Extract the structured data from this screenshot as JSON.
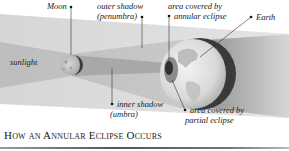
{
  "diagram": {
    "title": "How an Annular Eclipse Occurs",
    "labels": {
      "moon": "Moon",
      "sunlight": "sunlight",
      "outer_shadow_line1": "outer shadow",
      "outer_shadow_line2": "(penumbra)",
      "inner_shadow_line1": "inner shadow",
      "inner_shadow_line2": "(umbra)",
      "annular_line1": "area covered by",
      "annular_line2": "annular eclipse",
      "partial_line1": "area covered by",
      "partial_line2": "partial eclipse",
      "earth": "Earth"
    },
    "colors": {
      "background": "#ffffff",
      "penumbra": "#c8c8c8",
      "umbra": "#9a9a9a",
      "earth_dark_rim": "#333333",
      "text": "#222222"
    }
  }
}
